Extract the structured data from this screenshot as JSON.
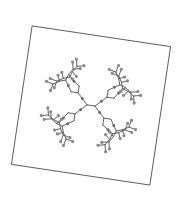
{
  "figure": {
    "type": "molecular-structure-diagram",
    "description": "Branched dendrimer-like molecule drawn inside a rotated square frame",
    "rotation_deg": 8.5,
    "frame": {
      "center": [
        91,
        105.5
      ],
      "size": 140
    },
    "colors": {
      "background": "#ffffff",
      "frame": "#555555",
      "bond": "#5a5a5a",
      "terminal_atom": "#8a8a8a",
      "linker_atom": "#6b6b6b"
    },
    "structure": {
      "core_atoms": 2,
      "first_generation_branches": 4,
      "second_generation_branches": 8,
      "terminal_groups": 16,
      "terminal_group_shape": "Y-fork with two end atoms"
    }
  }
}
